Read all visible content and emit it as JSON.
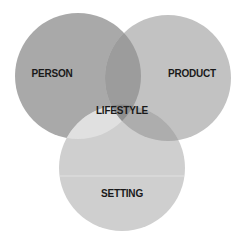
{
  "diagram": {
    "type": "venn-3",
    "sets": [
      {
        "id": "person",
        "label": "PERSON",
        "fill": "#a9a9a9",
        "cx": 78,
        "cy": 76,
        "r": 63,
        "label_x": 52,
        "label_y": 74
      },
      {
        "id": "product",
        "label": "PRODUCT",
        "fill": "#c2c2c2",
        "cx": 168,
        "cy": 78,
        "r": 63,
        "label_x": 192,
        "label_y": 74
      },
      {
        "id": "setting",
        "label": "SETTING",
        "fill": "#cfcfcf",
        "cx": 122,
        "cy": 168,
        "r": 63,
        "label_x": 122,
        "label_y": 194
      }
    ],
    "intersections": {
      "person_product": {
        "fill": "#9c9c9c"
      },
      "person_setting": {
        "fill": "#e0e0e0"
      },
      "product_setting": {
        "fill": "#adadad"
      },
      "center": {
        "label": "LIFESTYLE",
        "fill": "#8f8f8f",
        "label_x": 122,
        "label_y": 111
      }
    }
  }
}
